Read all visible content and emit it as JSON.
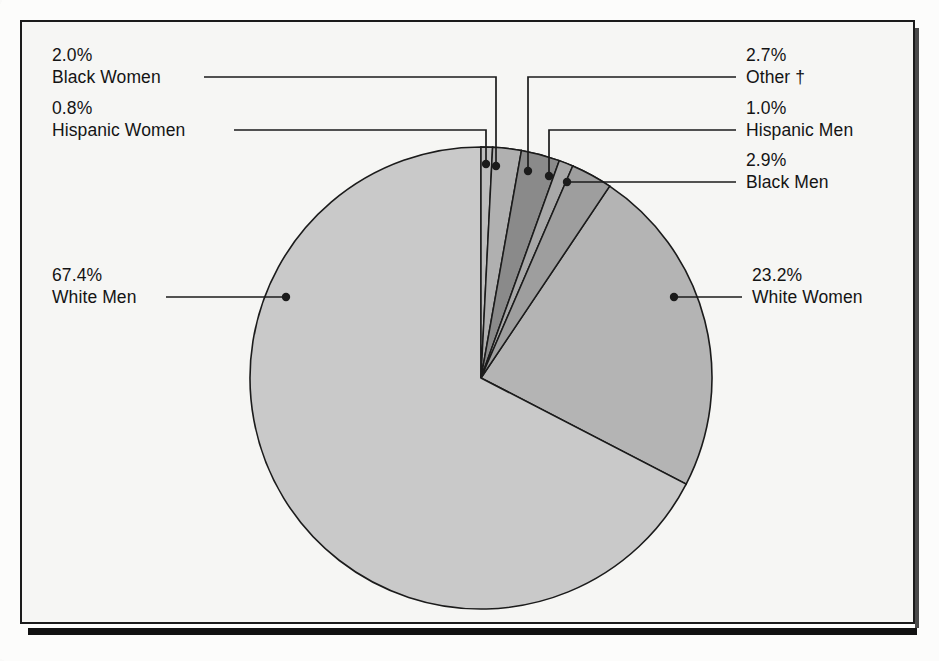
{
  "chart_data": {
    "type": "pie",
    "title": "",
    "subtitle": "",
    "xlabel": "",
    "ylabel": "",
    "legend_position": "callout-labels",
    "grid": false,
    "total_percent": 100.0,
    "categories": [
      "White Men",
      "White Women",
      "Black Men",
      "Other †",
      "Black Women",
      "Hispanic Men",
      "Hispanic Women"
    ],
    "values": [
      67.4,
      23.2,
      2.9,
      2.7,
      2.0,
      1.0,
      0.8
    ],
    "slices": [
      {
        "label": "White Men",
        "percent_text": "67.4%",
        "value": 67.4,
        "color": "#c9c9c9"
      },
      {
        "label": "White Women",
        "percent_text": "23.2%",
        "value": 23.2,
        "color": "#b4b4b4"
      },
      {
        "label": "Black Men",
        "percent_text": "2.9%",
        "value": 2.9,
        "color": "#9e9e9e"
      },
      {
        "label": "Other †",
        "percent_text": "2.7%",
        "value": 2.7,
        "color": "#8a8a8a"
      },
      {
        "label": "Black Women",
        "percent_text": "2.0%",
        "value": 2.0,
        "color": "#b0b0b0"
      },
      {
        "label": "Hispanic Men",
        "percent_text": "1.0%",
        "value": 1.0,
        "color": "#a8a8a8"
      },
      {
        "label": "Hispanic Women",
        "percent_text": "0.8%",
        "value": 0.8,
        "color": "#bdbdbd"
      }
    ]
  },
  "labels": {
    "black_women": {
      "percent": "2.0%",
      "name": "Black Women"
    },
    "hispanic_women": {
      "percent": "0.8%",
      "name": "Hispanic Women"
    },
    "white_men": {
      "percent": "67.4%",
      "name": "White Men"
    },
    "other": {
      "percent": "2.7%",
      "name": "Other †"
    },
    "hispanic_men": {
      "percent": "1.0%",
      "name": "Hispanic Men"
    },
    "black_men": {
      "percent": "2.9%",
      "name": "Black Men"
    },
    "white_women": {
      "percent": "23.2%",
      "name": "White Women"
    }
  },
  "footnote": {
    "text": ""
  },
  "colors": {
    "outline": "#1b1b1b",
    "background": "#f6f6f4",
    "slice_largest": "#c9c9c9",
    "slice_second": "#b4b4b4",
    "slice_dark": "#8a8a8a"
  }
}
